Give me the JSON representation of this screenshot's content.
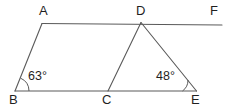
{
  "figure": {
    "stroke_color": "#5a5a5a",
    "text_color": "#1f1f1f",
    "background_color": "#ffffff",
    "vertices": [
      {
        "name": "A",
        "label": "A",
        "x": 42,
        "y": 23
      },
      {
        "name": "D",
        "label": "D",
        "x": 141,
        "y": 22
      },
      {
        "name": "F",
        "label": "F",
        "x": 222,
        "y": 24
      },
      {
        "name": "B",
        "label": "B",
        "x": 15,
        "y": 91
      },
      {
        "name": "C",
        "label": "C",
        "x": 108,
        "y": 91
      },
      {
        "name": "E",
        "label": "E",
        "x": 196,
        "y": 91
      }
    ],
    "segments": [
      {
        "name": "segment-AF",
        "from": "A",
        "to": "F"
      },
      {
        "name": "segment-BE",
        "from": "B",
        "to": "E"
      },
      {
        "name": "segment-AB",
        "from": "A",
        "to": "B"
      },
      {
        "name": "segment-CD",
        "from": "C",
        "to": "D"
      },
      {
        "name": "segment-DE",
        "from": "D",
        "to": "E"
      }
    ],
    "angles": [
      {
        "name": "angle-at-B",
        "vertex": "B",
        "label": "63°",
        "value": 63,
        "unit": "degrees"
      },
      {
        "name": "angle-at-E",
        "vertex": "E",
        "label": "48°",
        "value": 48,
        "unit": "degrees"
      }
    ]
  }
}
